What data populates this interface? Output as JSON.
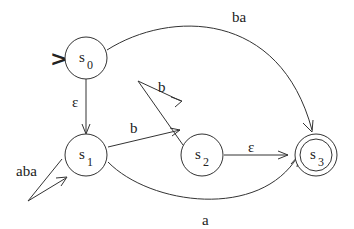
{
  "diagram": {
    "type": "finite automaton",
    "start_marker": ">",
    "states": [
      {
        "id": "s0",
        "base": "s",
        "sub": "0",
        "start": true,
        "accepting": false
      },
      {
        "id": "s1",
        "base": "s",
        "sub": "1",
        "start": false,
        "accepting": false
      },
      {
        "id": "s2",
        "base": "s",
        "sub": "2",
        "start": false,
        "accepting": false
      },
      {
        "id": "s3",
        "base": "s",
        "sub": "3",
        "start": false,
        "accepting": true
      }
    ],
    "transitions": [
      {
        "from": "s0",
        "to": "s3",
        "label": "ba"
      },
      {
        "from": "s0",
        "to": "s1",
        "label": "ε"
      },
      {
        "from": "s1",
        "to": "s1",
        "label": "aba"
      },
      {
        "from": "s1",
        "to": "s2",
        "label": "b"
      },
      {
        "from": "s2",
        "to": "s2",
        "label": "b"
      },
      {
        "from": "s2",
        "to": "s3",
        "label": "ε"
      },
      {
        "from": "s1",
        "to": "s3",
        "label": "a"
      }
    ]
  }
}
